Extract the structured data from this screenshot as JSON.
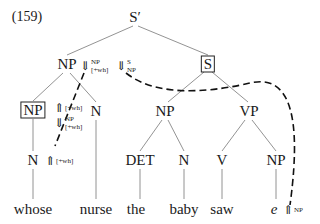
{
  "example_number": "(159)",
  "nodes": {
    "root": "S′",
    "np_wh": "NP",
    "s_boxed": "S",
    "np_boxed": "NP",
    "n_nurse": "N",
    "np_subj": "NP",
    "vp": "VP",
    "n_whose": "N",
    "det": "DET",
    "n_baby": "N",
    "v": "V",
    "np_obj": "NP"
  },
  "words": {
    "whose": "whose",
    "nurse": "nurse",
    "the": "the",
    "baby": "baby",
    "saw": "saw",
    "e": "e"
  },
  "annotations": {
    "np_down": {
      "arrow": "⇓",
      "top": "NP",
      "bottom": "[+wh]"
    },
    "s_down": {
      "arrow": "⇓",
      "top": "S",
      "bottom": "NP"
    },
    "np_boxed_up": {
      "arrow": "⇑",
      "label": "[+wh]"
    },
    "np_boxed_down": {
      "arrow": "⇓",
      "top": "NP",
      "bottom": "[+wh]"
    },
    "n_whose_up": {
      "arrow": "⇑",
      "label": "[+wh]"
    },
    "e_up": {
      "arrow": "⇑",
      "label": "NP"
    }
  },
  "colors": {
    "line": "#777777",
    "dash": "#111111",
    "text": "#1a1a1a"
  }
}
